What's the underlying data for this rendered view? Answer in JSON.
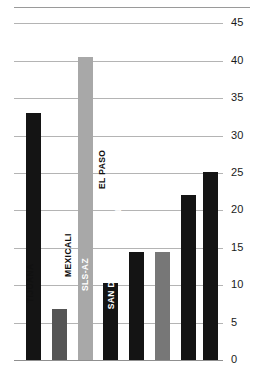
{
  "chart_data": {
    "type": "bar",
    "title": "",
    "subtitle": "",
    "xlabel": "",
    "ylabel": "",
    "categories": [
      "CIUDAD JUAREZ",
      "TIJUANA",
      "SAN LUIS RC",
      "MEXICALI",
      "SLS-AZ",
      "SAN DIEGO",
      "EL PASO",
      "CALEXICO"
    ],
    "values": [
      33.0,
      6.8,
      40.5,
      10.3,
      14.4,
      14.4,
      22.0,
      25.2
    ],
    "bar_colors": [
      "#141414",
      "#555555",
      "#a8a8a8",
      "#141414",
      "#141414",
      "#777777",
      "#141414",
      "#141414"
    ],
    "label_placement": [
      "inside",
      "above",
      "inside",
      "above",
      "inside",
      "inside",
      "above",
      "inside"
    ],
    "ylim": [
      0,
      45
    ],
    "yticks": [
      0,
      5,
      10,
      15,
      20,
      25,
      30,
      35,
      40,
      45
    ],
    "ytick_labels": [
      "0",
      "5",
      "10",
      "15",
      "20",
      "25",
      "30",
      "35",
      "40",
      "45"
    ],
    "grid": true,
    "grid_axis": "y",
    "legend": false,
    "legend_position": "none",
    "axis_line_color": "#8f8f8f",
    "grid_color": "#b4b4b4"
  }
}
